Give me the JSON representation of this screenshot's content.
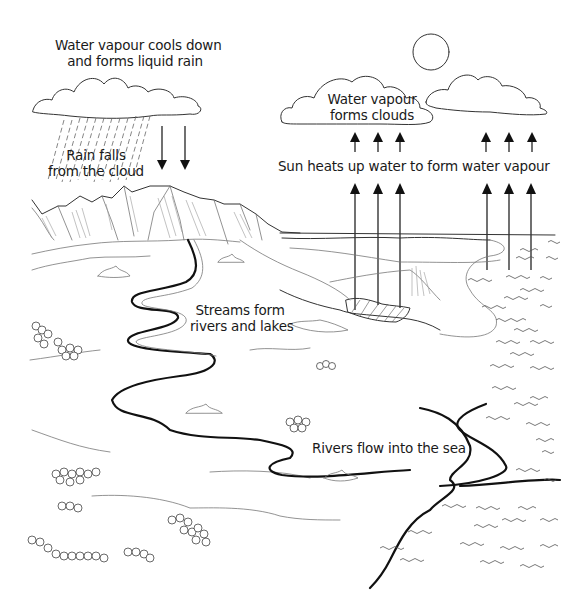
{
  "diagram": {
    "topic": "water cycle",
    "labels": {
      "condensation": [
        "Water vapour cools down",
        "and forms liquid rain"
      ],
      "precipitation": [
        "Rain falls",
        "from the cloud"
      ],
      "clouds": [
        "Water vapour",
        "forms clouds"
      ],
      "evaporation": "Sun heats up water to form water vapour",
      "collection": [
        "Streams form",
        "rivers and lakes"
      ],
      "runoff": "Rivers flow into the sea"
    },
    "elements": [
      {
        "name": "rain-cloud",
        "type": "cloud"
      },
      {
        "name": "rain",
        "type": "rain-streaks"
      },
      {
        "name": "down-arrows",
        "count": 2,
        "direction": "down"
      },
      {
        "name": "sun",
        "type": "circle"
      },
      {
        "name": "vapour-clouds",
        "count": 2,
        "type": "cloud"
      },
      {
        "name": "up-arrows-upper",
        "count": 6,
        "direction": "up"
      },
      {
        "name": "up-arrows-lower",
        "count": 6,
        "direction": "up"
      },
      {
        "name": "mountains",
        "type": "mountain-range"
      },
      {
        "name": "river",
        "type": "river"
      },
      {
        "name": "lake",
        "type": "hatched-lake"
      },
      {
        "name": "sea",
        "type": "waves"
      },
      {
        "name": "forests",
        "type": "tree-clusters"
      }
    ],
    "colors": {
      "line": "#111111",
      "background": "#ffffff"
    }
  }
}
